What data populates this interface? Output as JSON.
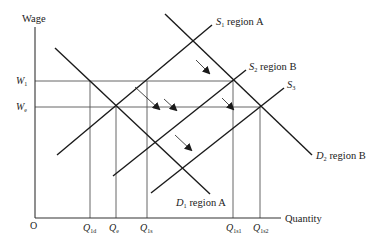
{
  "axes": {
    "y_label": "Wage",
    "x_label": "Quantity",
    "origin_label": "O"
  },
  "wage_levels": [
    {
      "id": "W1",
      "main": "W",
      "sub": "1",
      "y": 81
    },
    {
      "id": "We",
      "main": "W",
      "sub": "e",
      "y": 107
    }
  ],
  "quantity_levels": [
    {
      "id": "Q1d",
      "main": "Q",
      "sub": "1d",
      "x": 90
    },
    {
      "id": "Qe",
      "main": "Q",
      "sub": "e",
      "x": 116
    },
    {
      "id": "Q1s",
      "main": "Q",
      "sub": "1s",
      "x": 147
    },
    {
      "id": "Q1s1",
      "main": "Q",
      "sub": "1s1",
      "x": 233
    },
    {
      "id": "Q1s2",
      "main": "Q",
      "sub": "1s2",
      "x": 260
    }
  ],
  "curves": [
    {
      "id": "D1",
      "main": "D",
      "sub": "1",
      "suffix": " region A",
      "x1": 55,
      "y1": 48,
      "x2": 210,
      "y2": 194
    },
    {
      "id": "S1",
      "main": "S",
      "sub": "1",
      "suffix": " region A",
      "x1": 57,
      "y1": 155,
      "x2": 212,
      "y2": 25
    },
    {
      "id": "D2",
      "main": "D",
      "sub": "2",
      "suffix": " region B",
      "x1": 165,
      "y1": 14,
      "x2": 312,
      "y2": 155
    },
    {
      "id": "S2",
      "main": "S",
      "sub": "2",
      "suffix": " region B",
      "x1": 113,
      "y1": 176,
      "x2": 246,
      "y2": 70
    },
    {
      "id": "S3",
      "main": "S",
      "sub": "3",
      "suffix": "",
      "x1": 151,
      "y1": 193,
      "x2": 284,
      "y2": 88
    }
  ],
  "arrows": [
    {
      "x1": 135,
      "y1": 87,
      "x2": 159,
      "y2": 109
    },
    {
      "x1": 196,
      "y1": 60,
      "x2": 209,
      "y2": 73
    },
    {
      "x1": 164,
      "y1": 99,
      "x2": 176,
      "y2": 110
    },
    {
      "x1": 222,
      "y1": 98,
      "x2": 233,
      "y2": 109
    },
    {
      "x1": 175,
      "y1": 135,
      "x2": 191,
      "y2": 150
    }
  ],
  "colors": {
    "curve": "#1a1a1a",
    "guide": "#555555",
    "arrow": "#1a1a1a"
  }
}
